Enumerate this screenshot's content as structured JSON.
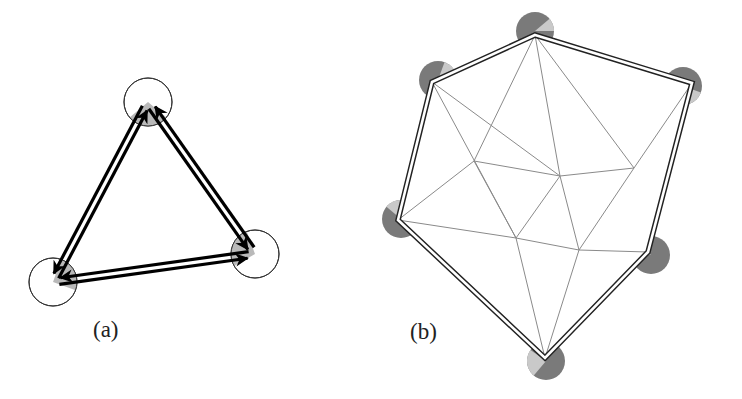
{
  "figure": {
    "panel_a": {
      "label": "(a)",
      "label_pos": [
        93,
        318
      ],
      "node_radius": 24,
      "node_fill": "#b9b9b9",
      "node_stroke": "#333333",
      "edge_color": "#000000",
      "nodes": [
        {
          "id": "top",
          "x": 148,
          "y": 102,
          "wedge": [
            40,
            140
          ]
        },
        {
          "id": "bottom-left",
          "x": 53,
          "y": 282,
          "wedge": [
            -70,
            20
          ]
        },
        {
          "id": "right",
          "x": 255,
          "y": 254,
          "wedge": [
            150,
            250
          ]
        }
      ],
      "edges": [
        {
          "from": "bottom-left",
          "to": "top"
        },
        {
          "from": "top",
          "to": "bottom-left"
        },
        {
          "from": "top",
          "to": "right"
        },
        {
          "from": "right",
          "to": "top"
        },
        {
          "from": "bottom-left",
          "to": "right"
        },
        {
          "from": "right",
          "to": "bottom-left"
        }
      ]
    },
    "panel_b": {
      "label": "(b)",
      "label_pos": [
        410,
        320
      ],
      "disc_radius": 19,
      "disc_dark": "#7a7a7a",
      "disc_light": "#c9c9c9",
      "boundary_color": "#222222",
      "mesh_color": "#8a8a8a",
      "boundary_nodes": [
        {
          "id": "top",
          "x": 535,
          "y": 35,
          "disc": [
            535,
            31
          ],
          "light": [
            -40,
            0
          ]
        },
        {
          "id": "right",
          "x": 692,
          "y": 83,
          "disc": [
            683,
            86
          ],
          "light": [
            20,
            90
          ]
        },
        {
          "id": "lower-right",
          "x": 648,
          "y": 252,
          "disc": [
            651,
            255
          ],
          "light": [
            200,
            230
          ]
        },
        {
          "id": "bottom",
          "x": 545,
          "y": 358,
          "disc": [
            546,
            361
          ],
          "light": [
            130,
            215
          ]
        },
        {
          "id": "left",
          "x": 398,
          "y": 220,
          "disc": [
            401,
            219
          ],
          "light": [
            220,
            300
          ]
        },
        {
          "id": "upper-left",
          "x": 432,
          "y": 82,
          "disc": [
            438,
            80
          ],
          "light": [
            -70,
            -10
          ]
        }
      ],
      "interior_nodes": [
        {
          "id": "A",
          "x": 474,
          "y": 161
        },
        {
          "id": "B",
          "x": 560,
          "y": 176
        },
        {
          "id": "C",
          "x": 634,
          "y": 168
        },
        {
          "id": "D",
          "x": 516,
          "y": 238
        },
        {
          "id": "E",
          "x": 579,
          "y": 250
        }
      ],
      "mesh_edges": [
        [
          "top",
          "A"
        ],
        [
          "top",
          "B"
        ],
        [
          "top",
          "C"
        ],
        [
          "upper-left",
          "B"
        ],
        [
          "upper-left",
          "D"
        ],
        [
          "right",
          "C"
        ],
        [
          "A",
          "B"
        ],
        [
          "A",
          "left"
        ],
        [
          "A",
          "D"
        ],
        [
          "B",
          "C"
        ],
        [
          "B",
          "D"
        ],
        [
          "B",
          "E"
        ],
        [
          "C",
          "E"
        ],
        [
          "left",
          "D"
        ],
        [
          "D",
          "E"
        ],
        [
          "D",
          "bottom"
        ],
        [
          "E",
          "bottom"
        ],
        [
          "E",
          "lower-right"
        ]
      ]
    }
  }
}
